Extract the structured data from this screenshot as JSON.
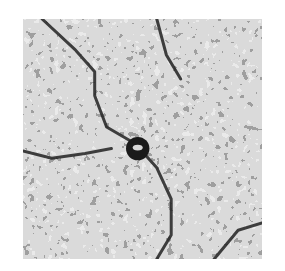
{
  "image": {
    "kind": "grayscale micrograph texture",
    "alt": "Noisy speckled grayscale texture with dark curved boundary lines and a dark ring-shaped particle near the center",
    "colors": {
      "background": "#ffffff",
      "base": "#a8a8a8",
      "light": "#d8d8d8",
      "dark": "#1a1a1a"
    },
    "features": [
      {
        "name": "boundary-line",
        "points": [
          [
            0.08,
            0.0
          ],
          [
            0.22,
            0.13
          ],
          [
            0.3,
            0.22
          ],
          [
            0.3,
            0.32
          ],
          [
            0.35,
            0.45
          ],
          [
            0.47,
            0.52
          ],
          [
            0.56,
            0.62
          ],
          [
            0.62,
            0.75
          ],
          [
            0.62,
            0.9
          ],
          [
            0.56,
            1.0
          ]
        ]
      },
      {
        "name": "boundary-line",
        "points": [
          [
            0.0,
            0.55
          ],
          [
            0.12,
            0.58
          ],
          [
            0.26,
            0.56
          ],
          [
            0.37,
            0.54
          ]
        ]
      },
      {
        "name": "boundary-line",
        "points": [
          [
            0.8,
            1.0
          ],
          [
            0.9,
            0.88
          ],
          [
            1.0,
            0.85
          ]
        ]
      },
      {
        "name": "boundary-line",
        "points": [
          [
            0.56,
            0.0
          ],
          [
            0.6,
            0.15
          ],
          [
            0.66,
            0.25
          ]
        ]
      }
    ],
    "particle": {
      "cx": 0.48,
      "cy": 0.54,
      "r": 0.035
    }
  }
}
